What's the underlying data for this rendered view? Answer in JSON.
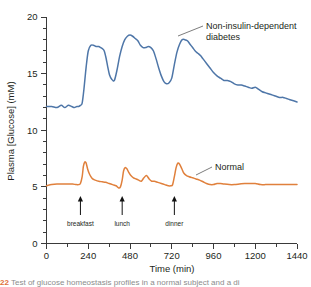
{
  "chart_data": {
    "type": "line",
    "title": "",
    "xlabel": "Time (min)",
    "ylabel": "Plasma [Glucose] (mM)",
    "xlim": [
      0,
      1440
    ],
    "ylim": [
      0,
      20
    ],
    "grid": false,
    "legend_position": "inline-annotation",
    "x_ticks_major": [
      0,
      240,
      480,
      720,
      960,
      1200,
      1440
    ],
    "x_tick_labels": [
      "0",
      "240",
      "480",
      "720",
      "960",
      "1200",
      "1440"
    ],
    "x_tick_minor_step": 120,
    "y_ticks_major": [
      0,
      5,
      10,
      15,
      20
    ],
    "y_tick_labels": [
      "0",
      "5",
      "10",
      "15",
      "20"
    ],
    "y_tick_minor_step": 1,
    "series": [
      {
        "name": "Non-insulin-dependent diabetes",
        "color": "#4e76a8",
        "x": [
          0,
          30,
          60,
          85,
          105,
          125,
          145,
          160,
          175,
          185,
          195,
          205,
          215,
          228,
          240,
          255,
          270,
          285,
          300,
          312,
          322,
          332,
          342,
          352,
          362,
          375,
          390,
          405,
          420,
          435,
          450,
          465,
          480,
          495,
          510,
          525,
          540,
          555,
          570,
          585,
          600,
          615,
          630,
          645,
          660,
          675,
          690,
          705,
          720,
          735,
          750,
          765,
          780,
          795,
          810,
          825,
          840,
          855,
          870,
          885,
          900,
          920,
          940,
          960,
          980,
          1000,
          1020,
          1040,
          1060,
          1080,
          1100,
          1120,
          1140,
          1160,
          1180,
          1200,
          1220,
          1240,
          1260,
          1280,
          1300,
          1320,
          1340,
          1360,
          1380,
          1400,
          1420,
          1440
        ],
        "y": [
          12.1,
          12.1,
          12.0,
          12.2,
          12.0,
          12.2,
          12.1,
          12.0,
          12.1,
          12.1,
          12.2,
          12.4,
          13.6,
          15.6,
          17.0,
          17.5,
          17.5,
          17.4,
          17.4,
          17.3,
          17.2,
          17.0,
          16.4,
          15.6,
          14.9,
          14.5,
          14.4,
          15.3,
          16.5,
          17.4,
          18.0,
          18.3,
          18.4,
          18.3,
          18.1,
          17.9,
          17.5,
          17.3,
          17.3,
          17.4,
          17.3,
          17.0,
          16.3,
          15.5,
          14.8,
          14.3,
          14.1,
          14.2,
          14.6,
          15.8,
          16.9,
          17.6,
          18.0,
          18.0,
          17.9,
          17.6,
          17.3,
          17.0,
          16.8,
          16.6,
          16.3,
          15.9,
          15.5,
          15.1,
          14.8,
          14.6,
          14.4,
          14.4,
          14.3,
          14.1,
          14.0,
          14.0,
          13.9,
          13.8,
          13.7,
          13.8,
          13.6,
          13.4,
          13.3,
          13.2,
          13.1,
          13.0,
          12.9,
          12.9,
          12.8,
          12.7,
          12.6,
          12.5
        ]
      },
      {
        "name": "Normal",
        "color": "#e0803c",
        "x": [
          0,
          30,
          60,
          90,
          120,
          150,
          170,
          185,
          195,
          205,
          212,
          220,
          228,
          236,
          245,
          255,
          265,
          280,
          300,
          320,
          340,
          360,
          380,
          400,
          415,
          425,
          435,
          443,
          452,
          462,
          472,
          485,
          500,
          515,
          530,
          545,
          560,
          575,
          590,
          605,
          620,
          640,
          660,
          680,
          700,
          715,
          725,
          735,
          745,
          755,
          765,
          778,
          790,
          805,
          820,
          840,
          860,
          880,
          900,
          920,
          940,
          960,
          980,
          1000,
          1020,
          1050,
          1080,
          1110,
          1140,
          1170,
          1200,
          1230,
          1260,
          1290,
          1320,
          1350,
          1380,
          1410,
          1440
        ],
        "y": [
          5.1,
          5.2,
          5.25,
          5.25,
          5.25,
          5.25,
          5.2,
          5.2,
          5.3,
          5.9,
          6.8,
          7.2,
          7.1,
          6.6,
          6.2,
          5.9,
          5.7,
          5.6,
          5.5,
          5.45,
          5.4,
          5.3,
          5.2,
          5.1,
          4.9,
          5.0,
          5.6,
          6.4,
          6.7,
          6.6,
          6.3,
          6.0,
          5.8,
          5.7,
          5.6,
          5.5,
          5.8,
          6.0,
          5.7,
          5.5,
          5.5,
          5.4,
          5.3,
          5.2,
          5.1,
          5.1,
          5.2,
          5.9,
          6.7,
          7.1,
          7.0,
          6.6,
          6.2,
          6.0,
          5.9,
          5.8,
          5.7,
          5.6,
          5.45,
          5.3,
          5.2,
          5.2,
          5.3,
          5.3,
          5.25,
          5.2,
          5.2,
          5.25,
          5.3,
          5.3,
          5.3,
          5.2,
          5.2,
          5.2,
          5.2,
          5.2,
          5.2,
          5.2,
          5.2
        ]
      }
    ],
    "annotations": [
      {
        "id": "diabetes-label",
        "text_line1": "Non-insulin-dependent",
        "text_line2": "diabetes",
        "x": 960,
        "y": 18.3
      },
      {
        "id": "normal-label",
        "text": "Normal",
        "x": 1000,
        "y": 7.3
      },
      {
        "id": "meal-breakfast",
        "text": "breakfast",
        "x": 195
      },
      {
        "id": "meal-lunch",
        "text": "lunch",
        "x": 435
      },
      {
        "id": "meal-dinner",
        "text": "dinner",
        "x": 735
      }
    ]
  },
  "axis": {
    "y_title": "Plasma [Glucose] (mM)",
    "x_title": "Time (min)",
    "y_labels": [
      "20",
      "15",
      "10",
      "5",
      "0"
    ],
    "x_labels": [
      "0",
      "240",
      "480",
      "720",
      "960",
      "1200",
      "1440"
    ]
  },
  "annotations": {
    "diabetes_line1": "Non-insulin-dependent",
    "diabetes_line2": "diabetes",
    "normal": "Normal",
    "breakfast": "breakfast",
    "lunch": "lunch",
    "dinner": "dinner"
  },
  "caption": {
    "number": "22",
    "text": "Test of glucose homeostasis profiles in a normal subject and a di"
  },
  "colors": {
    "diabetes": "#4e76a8",
    "normal": "#e0803c",
    "axis": "#3a3a3a",
    "text": "#231f20"
  }
}
